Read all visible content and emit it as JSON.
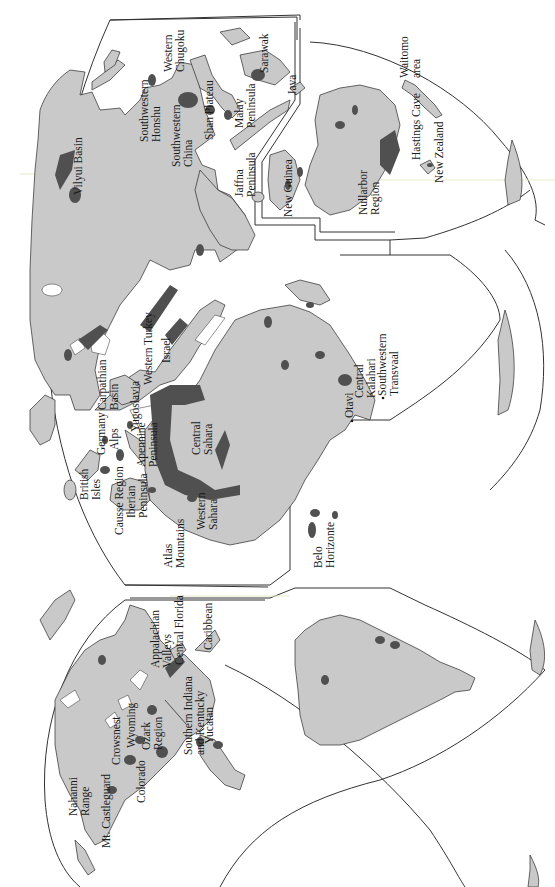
{
  "map": {
    "subject": "World karst regions",
    "orientation": "rotated 90 degrees counter-clockwise",
    "projection": "interrupted (Goode-like) world projection",
    "colors": {
      "land": "#c9c9c9",
      "karst": "#505050",
      "outline": "#2a2a2a",
      "background": "#ffffff"
    },
    "labels": {
      "north_america": [
        {
          "id": "nahanni",
          "lines": [
            "Nahanni",
            "Range"
          ]
        },
        {
          "id": "castleguard",
          "lines": [
            "Mt. Castleguard"
          ]
        },
        {
          "id": "crowsnest",
          "lines": [
            "Crowsnest"
          ]
        },
        {
          "id": "wyoming",
          "lines": [
            "Wyoming"
          ]
        },
        {
          "id": "colorado",
          "lines": [
            "Colorado"
          ]
        },
        {
          "id": "ozark",
          "lines": [
            "Ozark",
            "Region"
          ]
        },
        {
          "id": "southern_indiana",
          "lines": [
            "Southern Indiana",
            "and Kentucky"
          ]
        },
        {
          "id": "yucatan",
          "lines": [
            "Yucatan"
          ]
        },
        {
          "id": "appalachian",
          "lines": [
            "Appalachian",
            "Valleys"
          ]
        },
        {
          "id": "central_florida",
          "lines": [
            "Central Florida"
          ]
        },
        {
          "id": "caribbean",
          "lines": [
            "Caribbean"
          ]
        }
      ],
      "south_america": [
        {
          "id": "belo_horizonte",
          "lines": [
            "Belo",
            "Horizonte"
          ]
        }
      ],
      "europe_africa": [
        {
          "id": "british_isles",
          "lines": [
            "British",
            "Isles"
          ]
        },
        {
          "id": "causse",
          "lines": [
            "Causse Region"
          ]
        },
        {
          "id": "iberian",
          "lines": [
            "Iberian",
            "Peninsula"
          ]
        },
        {
          "id": "atlas",
          "lines": [
            "Atlas",
            "Mountains"
          ]
        },
        {
          "id": "germany",
          "lines": [
            "Germany"
          ]
        },
        {
          "id": "alps",
          "lines": [
            "Alps"
          ]
        },
        {
          "id": "apennine",
          "lines": [
            "Apennine",
            "Peninsula"
          ]
        },
        {
          "id": "carpathian",
          "lines": [
            "Carpathian",
            "Basin"
          ]
        },
        {
          "id": "yugoslavia",
          "lines": [
            "Yugoslavia"
          ]
        },
        {
          "id": "western_turkey",
          "lines": [
            "Western Turkey"
          ]
        },
        {
          "id": "israel",
          "lines": [
            "Israel"
          ]
        },
        {
          "id": "western_sahara",
          "lines": [
            "Western",
            "Sahara"
          ]
        },
        {
          "id": "central_sahara",
          "lines": [
            "Central",
            "Sahara"
          ]
        },
        {
          "id": "otavi",
          "lines": [
            "Otavi"
          ]
        },
        {
          "id": "central_kalahari",
          "lines": [
            "Central",
            "Kalahari"
          ]
        },
        {
          "id": "sw_transvaal",
          "lines": [
            "Southwestern",
            "Transvaal"
          ]
        }
      ],
      "asia": [
        {
          "id": "vilyui",
          "lines": [
            "Vilyui Basin"
          ]
        },
        {
          "id": "sw_honshu",
          "lines": [
            "Southwestern",
            "Honshu"
          ]
        },
        {
          "id": "w_chugoku",
          "lines": [
            "Western",
            "Chugoku"
          ]
        },
        {
          "id": "sw_china",
          "lines": [
            "Southwestern",
            "China"
          ]
        },
        {
          "id": "shan",
          "lines": [
            "Shan Plateau"
          ]
        },
        {
          "id": "malay",
          "lines": [
            "Malay",
            "Peninsula"
          ]
        },
        {
          "id": "jaffna",
          "lines": [
            "Jaffna",
            "Peninsula"
          ]
        },
        {
          "id": "sarawak",
          "lines": [
            "Sarawak"
          ]
        },
        {
          "id": "java",
          "lines": [
            "Java"
          ]
        }
      ],
      "oceania": [
        {
          "id": "new_guinea",
          "lines": [
            "New Guinea"
          ]
        },
        {
          "id": "nullarbor",
          "lines": [
            "Nullarbor",
            "Region"
          ]
        },
        {
          "id": "waitomo",
          "lines": [
            "Waitomo",
            "area"
          ]
        },
        {
          "id": "hastings",
          "lines": [
            "Hastings Cave"
          ]
        },
        {
          "id": "new_zealand",
          "lines": [
            "New Zealand"
          ]
        }
      ]
    }
  }
}
